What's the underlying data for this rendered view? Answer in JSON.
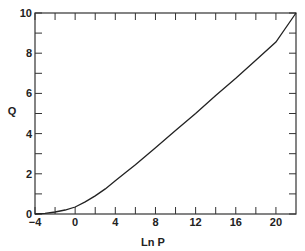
{
  "chart_data": {
    "type": "line",
    "title": "",
    "xlabel": "Ln P",
    "ylabel": "Q",
    "xlim": [
      -4,
      22
    ],
    "ylim": [
      0,
      10
    ],
    "grid": false,
    "legend": null,
    "x_ticks": [
      -4,
      0,
      4,
      8,
      12,
      16,
      20
    ],
    "x_minor_ticks": [
      -2,
      2,
      6,
      10,
      14,
      18
    ],
    "y_ticks": [
      0,
      2,
      4,
      6,
      8,
      10
    ],
    "y_minor_ticks": [
      1,
      3,
      5,
      7,
      9
    ],
    "series": [
      {
        "name": "Q vs Ln P",
        "x": [
          -4,
          -3,
          -2,
          -1,
          0,
          1,
          2,
          3,
          4,
          5,
          6,
          8,
          10,
          12,
          14,
          16,
          18,
          20,
          22
        ],
        "y": [
          0.0,
          0.03,
          0.1,
          0.2,
          0.35,
          0.6,
          0.9,
          1.25,
          1.65,
          2.05,
          2.45,
          3.3,
          4.15,
          5.0,
          5.9,
          6.75,
          7.65,
          8.55,
          10.0
        ]
      }
    ]
  }
}
